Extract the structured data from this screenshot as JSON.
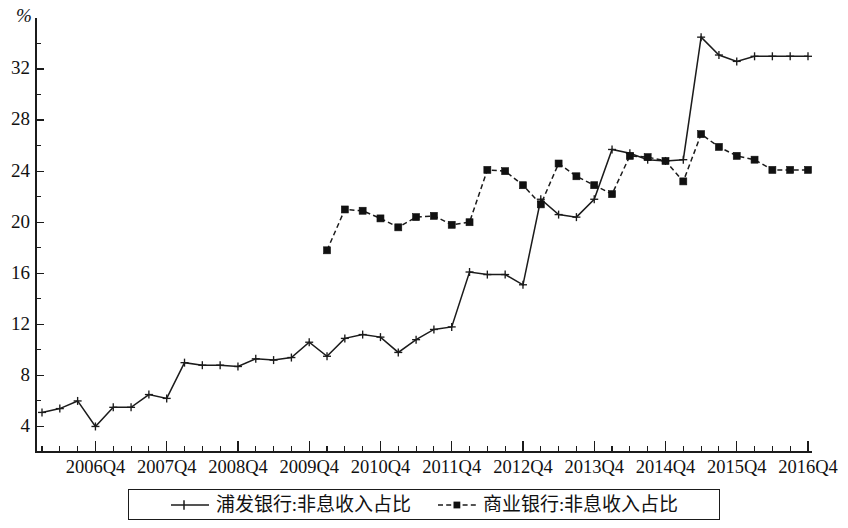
{
  "chart_data": {
    "type": "line",
    "title": "",
    "subtitle": "",
    "xlabel": "",
    "ylabel": "%",
    "yunit": "%",
    "ylim": [
      2,
      36
    ],
    "yticks_major": [
      4,
      8,
      12,
      16,
      20,
      24,
      28,
      32
    ],
    "yticks_minor": [
      6,
      10,
      14,
      18,
      22,
      26,
      30,
      34
    ],
    "grid": false,
    "legend_position": "bottom",
    "x_axis_type": "quarterly",
    "x_start": "2006Q1",
    "x_end": "2016Q4",
    "x_tick_labels": [
      "2006Q4",
      "2007Q4",
      "2008Q4",
      "2009Q4",
      "2010Q4",
      "2011Q4",
      "2012Q4",
      "2013Q4",
      "2014Q4",
      "2015Q4",
      "2016Q4"
    ],
    "x_all_periods": [
      "2006Q1",
      "2006Q2",
      "2006Q3",
      "2006Q4",
      "2007Q1",
      "2007Q2",
      "2007Q3",
      "2007Q4",
      "2008Q1",
      "2008Q2",
      "2008Q3",
      "2008Q4",
      "2009Q1",
      "2009Q2",
      "2009Q3",
      "2009Q4",
      "2010Q1",
      "2010Q2",
      "2010Q3",
      "2010Q4",
      "2011Q1",
      "2011Q2",
      "2011Q3",
      "2011Q4",
      "2012Q1",
      "2012Q2",
      "2012Q3",
      "2012Q4",
      "2013Q1",
      "2013Q2",
      "2013Q3",
      "2013Q4",
      "2014Q1",
      "2014Q2",
      "2014Q3",
      "2014Q4",
      "2015Q1",
      "2015Q2",
      "2015Q3",
      "2015Q4",
      "2016Q1",
      "2016Q2",
      "2016Q3",
      "2016Q4"
    ],
    "series": [
      {
        "name": "浦发银行:非息收入占比",
        "marker": "plus",
        "linestyle": "solid",
        "color": "#1b1b1b",
        "x": [
          "2006Q1",
          "2006Q2",
          "2006Q3",
          "2006Q4",
          "2007Q1",
          "2007Q2",
          "2007Q3",
          "2007Q4",
          "2008Q1",
          "2008Q2",
          "2008Q3",
          "2008Q4",
          "2009Q1",
          "2009Q2",
          "2009Q3",
          "2009Q4",
          "2010Q1",
          "2010Q2",
          "2010Q3",
          "2010Q4",
          "2011Q1",
          "2011Q2",
          "2011Q3",
          "2011Q4",
          "2012Q1",
          "2012Q2",
          "2012Q3",
          "2012Q4",
          "2013Q1",
          "2013Q2",
          "2013Q3",
          "2013Q4",
          "2014Q1",
          "2014Q2",
          "2014Q3",
          "2014Q4",
          "2015Q1",
          "2015Q2",
          "2015Q3",
          "2015Q4",
          "2016Q1",
          "2016Q2",
          "2016Q3",
          "2016Q4"
        ],
        "values": [
          5.1,
          5.4,
          6.0,
          4.0,
          5.5,
          5.5,
          6.5,
          6.2,
          9.0,
          8.8,
          8.8,
          8.7,
          9.3,
          9.2,
          9.4,
          10.6,
          9.5,
          10.9,
          11.2,
          11.0,
          9.8,
          10.8,
          11.6,
          11.8,
          16.1,
          15.9,
          15.9,
          15.1,
          21.8,
          20.6,
          20.4,
          21.8,
          25.7,
          25.4,
          24.9,
          24.8,
          24.9,
          34.5,
          33.1,
          32.6,
          33.0,
          33.0,
          33.0,
          33.0
        ]
      },
      {
        "name": "商业银行:非息收入占比",
        "marker": "square",
        "linestyle": "dashed",
        "color": "#1b1b1b",
        "x": [
          "2010Q1",
          "2010Q2",
          "2010Q3",
          "2010Q4",
          "2011Q1",
          "2011Q2",
          "2011Q3",
          "2011Q4",
          "2012Q1",
          "2012Q2",
          "2012Q3",
          "2012Q4",
          "2013Q1",
          "2013Q2",
          "2013Q3",
          "2013Q4",
          "2014Q1",
          "2014Q2",
          "2014Q3",
          "2014Q4",
          "2015Q1",
          "2015Q2",
          "2015Q3",
          "2015Q4",
          "2016Q1",
          "2016Q2",
          "2016Q3",
          "2016Q4"
        ],
        "values": [
          17.8,
          21.0,
          20.9,
          20.3,
          19.6,
          20.4,
          20.5,
          19.8,
          20.0,
          24.1,
          24.0,
          22.9,
          21.4,
          24.6,
          23.6,
          22.9,
          22.2,
          25.2,
          25.1,
          24.8,
          23.2,
          26.9,
          25.9,
          25.2,
          24.9,
          24.1,
          24.1,
          24.1
        ]
      }
    ],
    "annotations": []
  },
  "legend": {
    "entries": [
      {
        "label": "浦发银行:非息收入占比",
        "marker": "plus",
        "linestyle": "solid"
      },
      {
        "label": "商业银行:非息收入占比",
        "marker": "square",
        "linestyle": "dashed"
      }
    ]
  }
}
